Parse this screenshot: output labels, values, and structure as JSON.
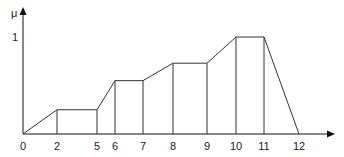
{
  "chart_data": {
    "type": "line",
    "title": "",
    "xlabel": "",
    "ylabel": "μ",
    "x": [
      0,
      2,
      5,
      6,
      7,
      8,
      9,
      10,
      11,
      12
    ],
    "series": [
      {
        "name": "membership",
        "points": [
          [
            0,
            0
          ],
          [
            2,
            0.25
          ],
          [
            5,
            0.25
          ],
          [
            6,
            0.55
          ],
          [
            7,
            0.55
          ],
          [
            8,
            0.73
          ],
          [
            9,
            0.73
          ],
          [
            10,
            1
          ],
          [
            11,
            1
          ],
          [
            12,
            0
          ]
        ]
      }
    ],
    "vertical_lines_at": [
      2,
      5,
      6,
      7,
      8,
      9,
      10,
      11
    ],
    "xtick_labels": [
      "0",
      "2",
      "5",
      "6",
      "7",
      "8",
      "9",
      "10",
      "11",
      "12"
    ],
    "ytick_labels": [
      "1"
    ],
    "ylim": [
      0,
      1
    ],
    "grid": false,
    "legend": null
  },
  "colors": {
    "line": "#333333",
    "axis": "#111111"
  }
}
